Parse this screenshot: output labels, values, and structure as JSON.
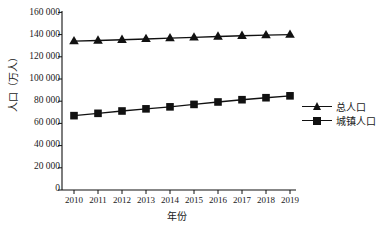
{
  "chart_data": {
    "type": "line",
    "title": "",
    "xlabel": "年份",
    "ylabel": "人口（万人）",
    "categories": [
      "2010",
      "2011",
      "2012",
      "2013",
      "2014",
      "2015",
      "2016",
      "2017",
      "2018",
      "2019"
    ],
    "series": [
      {
        "name": "总人口",
        "marker": "triangle",
        "color": "#111111",
        "values": [
          134100,
          134700,
          135400,
          136100,
          136800,
          137500,
          138300,
          139000,
          139500,
          140000
        ]
      },
      {
        "name": "城镇人口",
        "marker": "square",
        "color": "#111111",
        "values": [
          66978,
          69079,
          71182,
          73111,
          74916,
          77116,
          79298,
          81347,
          83137,
          84843
        ]
      }
    ],
    "ylim": [
      0,
      160000
    ],
    "yticks": [
      0,
      20000,
      40000,
      60000,
      80000,
      100000,
      120000,
      140000,
      160000
    ],
    "ytick_labels": [
      "0",
      "20 000",
      "40 000",
      "60 000",
      "80 000",
      "100 000",
      "120 000",
      "140 000",
      "160 000"
    ],
    "grid": false,
    "legend_position": "right"
  },
  "legend": {
    "entries": [
      {
        "label": "总人口",
        "marker": "triangle-marker-icon"
      },
      {
        "label": "城镇人口",
        "marker": "square-marker-icon"
      }
    ]
  }
}
